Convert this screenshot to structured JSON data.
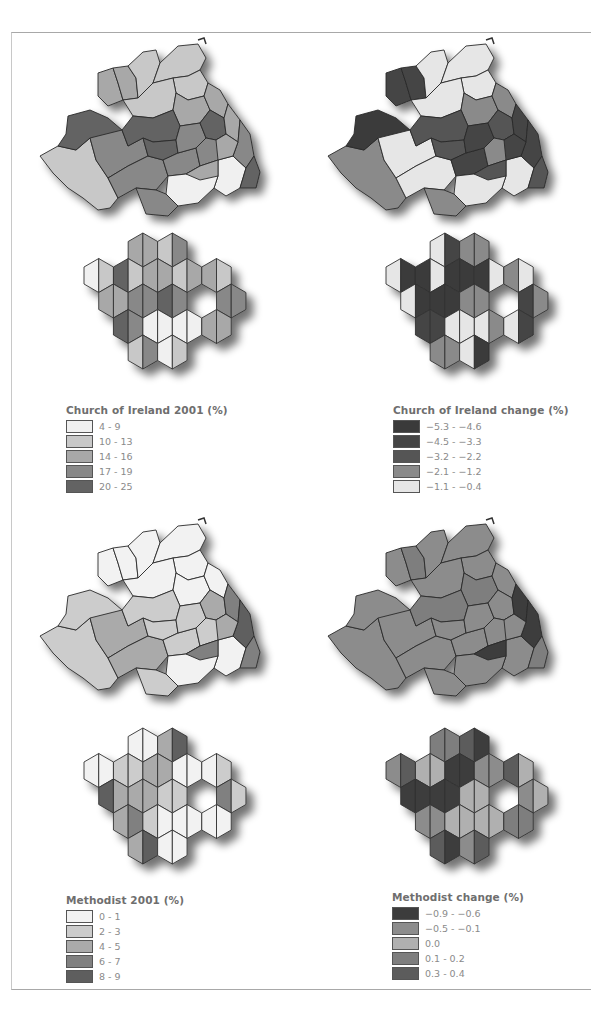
{
  "figure": {
    "panels": [
      {
        "id": "coi-2001",
        "title": "Church of Ireland 2001 (%)"
      },
      {
        "id": "coi-change",
        "title": "Church of Ireland change (%)"
      },
      {
        "id": "methodist-2001",
        "title": "Methodist 2001 (%)"
      },
      {
        "id": "methodist-change",
        "title": "Methodist change (%)"
      }
    ]
  },
  "legends": {
    "coi_2001": {
      "title": "Church of Ireland 2001 (%)",
      "items": [
        {
          "label": "4  -  9",
          "color": "#f0f0f0"
        },
        {
          "label": "10 - 13",
          "color": "#c8c8c8"
        },
        {
          "label": "14 - 16",
          "color": "#a8a8a8"
        },
        {
          "label": "17 - 19",
          "color": "#888888"
        },
        {
          "label": "20 - 25",
          "color": "#636363"
        }
      ]
    },
    "coi_change": {
      "title": "Church of Ireland change (%)",
      "items": [
        {
          "label": "−5.3 - −4.6",
          "color": "#3a3a3a"
        },
        {
          "label": "−4.5 - −3.3",
          "color": "#454545"
        },
        {
          "label": "−3.2 - −2.2",
          "color": "#555555"
        },
        {
          "label": "−2.1 - −1.2",
          "color": "#8a8a8a"
        },
        {
          "label": "−1.1 - −0.4",
          "color": "#e6e6e6"
        }
      ]
    },
    "methodist_2001": {
      "title": "Methodist 2001 (%)",
      "items": [
        {
          "label": "0 - 1",
          "color": "#f2f2f2"
        },
        {
          "label": "2 - 3",
          "color": "#cccccc"
        },
        {
          "label": "4 - 5",
          "color": "#aaaaaa"
        },
        {
          "label": "6 - 7",
          "color": "#808080"
        },
        {
          "label": "8 - 9",
          "color": "#5e5e5e"
        }
      ]
    },
    "methodist_change": {
      "title": "Methodist change (%)",
      "items": [
        {
          "label": "−0.9 - −0.6",
          "color": "#3c3c3c"
        },
        {
          "label": "−0.5 - −0.1",
          "color": "#8c8c8c"
        },
        {
          "label": "0.0",
          "color": "#b0b0b0"
        },
        {
          "label": "0.1 -  0.2",
          "color": "#7e7e7e"
        },
        {
          "label": "0.3 -  0.4",
          "color": "#5c5c5c"
        }
      ]
    }
  },
  "chart_data": [
    {
      "type": "choropleth",
      "title": "Church of Ireland 2001 (%)",
      "region": "Northern Ireland (district councils)",
      "classes": [
        "4 - 9",
        "10 - 13",
        "14 - 16",
        "17 - 19",
        "20 - 25"
      ],
      "region_classes": [
        1,
        4,
        2,
        2,
        1,
        1,
        1,
        1,
        2,
        2,
        3,
        3,
        4,
        4,
        3,
        3,
        4,
        3,
        0,
        0,
        3,
        2,
        2,
        3,
        2,
        4
      ],
      "hex_classes": [
        2,
        2,
        1,
        3,
        0,
        1,
        4,
        1,
        2,
        2,
        1,
        2,
        2,
        1,
        2,
        2,
        3,
        3,
        4,
        3,
        3,
        3,
        4,
        3,
        0,
        0,
        0,
        0
      ]
    },
    {
      "type": "choropleth",
      "title": "Church of Ireland change (%)",
      "region": "Northern Ireland (district councils)",
      "classes": [
        "-5.3 - -4.6",
        "-4.5 - -3.3",
        "-3.2 - -2.2",
        "-2.1 - -1.2",
        "-1.1 - -0.4"
      ],
      "region_classes": [
        3,
        0,
        1,
        1,
        4,
        4,
        4,
        4,
        3,
        3,
        4,
        4,
        2,
        2,
        1,
        1,
        2,
        3,
        4,
        4,
        3,
        2,
        1,
        1,
        1,
        2
      ],
      "hex_classes": [
        4,
        1,
        3,
        3,
        4,
        0,
        0,
        4,
        0,
        0,
        0,
        4,
        3,
        4,
        4,
        0,
        0,
        0,
        3,
        3,
        1,
        3,
        1,
        1,
        4,
        4,
        4,
        3
      ]
    },
    {
      "type": "choropleth",
      "title": "Methodist 2001 (%)",
      "region": "Northern Ireland (district councils)",
      "classes": [
        "0 - 1",
        "2 - 3",
        "4 - 5",
        "6 - 7",
        "8 - 9"
      ],
      "region_classes": [
        1,
        1,
        0,
        0,
        0,
        0,
        0,
        0,
        0,
        0,
        2,
        2,
        1,
        1,
        1,
        1,
        2,
        1,
        0,
        0,
        1,
        3,
        3,
        4,
        2,
        3
      ],
      "hex_classes": [
        0,
        0,
        2,
        4,
        0,
        0,
        1,
        1,
        2,
        2,
        0,
        0,
        0,
        1,
        4,
        2,
        2,
        2,
        1,
        1,
        3,
        1,
        2,
        3,
        1,
        0,
        0,
        0
      ]
    },
    {
      "type": "choropleth",
      "title": "Methodist change (%)",
      "region": "Northern Ireland (district councils)",
      "classes": [
        "-0.9 - -0.6",
        "-0.5 - -0.1",
        "0.0",
        "0.1 - 0.2",
        "0.3 - 0.4"
      ],
      "region_classes": [
        1,
        1,
        1,
        3,
        1,
        1,
        1,
        1,
        3,
        1,
        1,
        1,
        3,
        1,
        1,
        1,
        1,
        1,
        1,
        1,
        1,
        0,
        0,
        0,
        1,
        3
      ],
      "hex_classes": [
        3,
        3,
        4,
        0,
        1,
        4,
        2,
        2,
        0,
        0,
        1,
        1,
        4,
        2,
        0,
        0,
        0,
        0,
        2,
        2,
        1,
        2,
        1,
        1,
        2,
        2,
        2,
        2
      ]
    }
  ]
}
